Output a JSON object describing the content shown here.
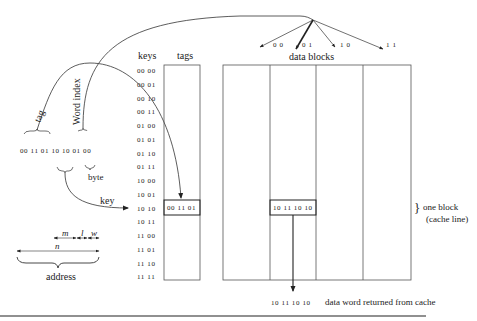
{
  "diagram": {
    "address": {
      "bits": "00 11 01 10 10 01 00",
      "tag_label": "tag",
      "word_index_label": "Word index",
      "byte_label": "byte",
      "key_label": "key",
      "address_label": "address",
      "field_m": "m",
      "field_l": "l",
      "field_w": "w",
      "field_n": "n"
    },
    "keys_header": "keys",
    "tags_header": "tags",
    "keys": [
      "00 00",
      "00 01",
      "00 10",
      "00 11",
      "01 00",
      "01 01",
      "01 10",
      "01 11",
      "10 00",
      "10 01",
      "10 10",
      "10 11",
      "11 00",
      "11 01",
      "11 10",
      "11 11"
    ],
    "selected_key_index": 10,
    "selected_tag_value": "00 11 01",
    "data_blocks_label": "data blocks",
    "word_selectors": [
      "0 0",
      "0 1",
      "1 0",
      "1 1"
    ],
    "selected_word_index": 1,
    "selected_data_word": "10 11 10 10",
    "one_block_label": "one block",
    "cache_line_label": "(cache line)",
    "returned_word": "10 11 10 10",
    "returned_label": "data word returned from cache"
  }
}
